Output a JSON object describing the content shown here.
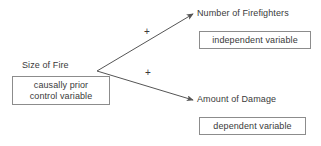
{
  "diagram": {
    "type": "causal-path-diagram",
    "nodes": [
      {
        "id": "cause",
        "label": "Size of Fire"
      },
      {
        "id": "firefighters",
        "label": "Number of Firefighters"
      },
      {
        "id": "damage",
        "label": "Amount of Damage"
      }
    ],
    "annotations": [
      {
        "id": "control",
        "line1": "causally prior",
        "line2": "control variable"
      },
      {
        "id": "independent",
        "line1": "independent variable",
        "line2": ""
      },
      {
        "id": "dependent",
        "line1": "dependent variable",
        "line2": ""
      }
    ],
    "edges": [
      {
        "id": "cause-to-firefighters",
        "from": "cause",
        "to": "firefighters",
        "sign": "+"
      },
      {
        "id": "cause-to-damage",
        "from": "cause",
        "to": "damage",
        "sign": "+"
      }
    ],
    "colors": {
      "text": "#3a3a3a",
      "stroke": "#555555",
      "box_border": "#8c8c8c",
      "background": "#ffffff"
    }
  }
}
